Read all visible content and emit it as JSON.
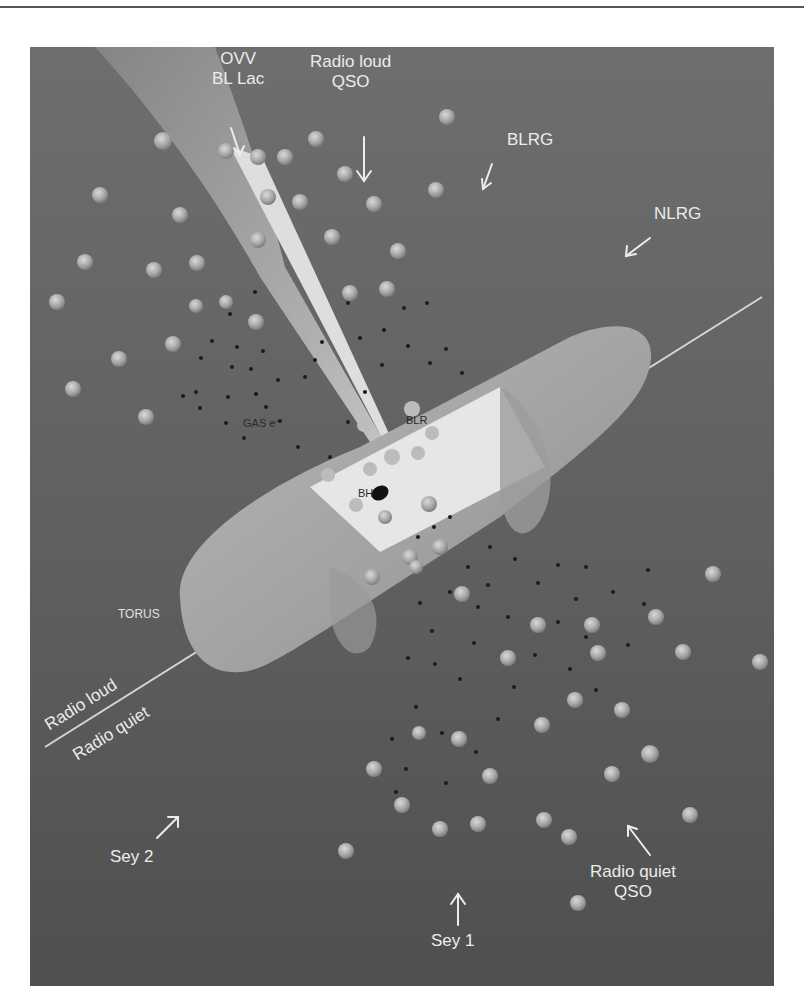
{
  "figure": {
    "colors": {
      "background": "#ffffff",
      "panel": "#636363",
      "torus": "#a8a8a8",
      "blr_region": "#e6e6e6",
      "jet": "#d8d8d8",
      "label_text": "#ececec",
      "inner_label_text": "#2a2a2a"
    },
    "viewing_labels": {
      "ovv_bl_lac": {
        "line1": "OVV",
        "line2": "BL Lac",
        "arrow": "down"
      },
      "radio_loud_qso": {
        "line1": "Radio loud",
        "line2": "QSO",
        "arrow": "down"
      },
      "blrg": {
        "line1": "BLRG",
        "arrow": "down-left"
      },
      "nlrg": {
        "line1": "NLRG",
        "arrow": "down-left"
      },
      "sey2": {
        "line1": "Sey 2",
        "arrow": "up-right"
      },
      "sey1": {
        "line1": "Sey 1",
        "arrow": "up"
      },
      "radio_quiet_qso": {
        "line1": "Radio quiet",
        "line2": "QSO",
        "arrow": "up-left"
      }
    },
    "component_labels": {
      "torus": "TORUS",
      "gas": "GAS e⁻",
      "blr": "BLR",
      "bh": "BH"
    },
    "divider": {
      "upper": "Radio loud",
      "lower": "Radio quiet"
    }
  }
}
